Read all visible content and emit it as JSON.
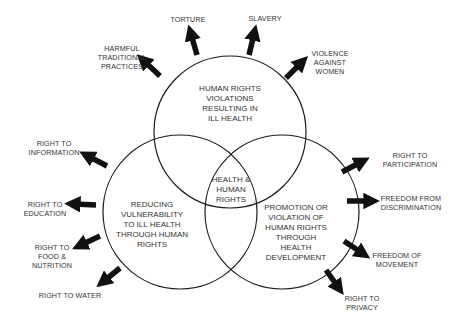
{
  "diagram": {
    "type": "venn-with-arrows",
    "circles": [
      {
        "id": "top",
        "label_lines": [
          "HUMAN RIGHTS",
          "VIOLATIONS",
          "RESULTING IN",
          "ILL HEALTH"
        ]
      },
      {
        "id": "left",
        "label_lines": [
          "REDUCING",
          "VULNERABILITY",
          "TO ILL HEALTH",
          "THROUGH HUMAN",
          "RIGHTS"
        ]
      },
      {
        "id": "right",
        "label_lines": [
          "PROMOTION OR",
          "VIOLATION OF",
          "HUMAN RIGHTS",
          "THROUGH",
          "HEALTH",
          "DEVELOPMENT"
        ]
      }
    ],
    "center": {
      "label_lines": [
        "HEALTH &",
        "HUMAN",
        "RIGHTS"
      ]
    },
    "top_arrows": [
      {
        "label_lines": [
          "HARMFUL",
          "TRADITIONAL",
          "PRACTICES"
        ]
      },
      {
        "label_lines": [
          "TORTURE"
        ]
      },
      {
        "label_lines": [
          "SLAVERY"
        ]
      },
      {
        "label_lines": [
          "VIOLENCE",
          "AGAINST",
          "WOMEN"
        ]
      }
    ],
    "left_arrows": [
      {
        "label_lines": [
          "RIGHT TO",
          "INFORMATION"
        ]
      },
      {
        "label_lines": [
          "RIGHT TO",
          "EDUCATION"
        ]
      },
      {
        "label_lines": [
          "RIGHT TO",
          "FOOD &",
          "NUTRITION"
        ]
      },
      {
        "label_lines": [
          "RIGHT TO WATER"
        ]
      }
    ],
    "right_arrows": [
      {
        "label_lines": [
          "RIGHT TO",
          "PARTICIPATION"
        ]
      },
      {
        "label_lines": [
          "FREEDOM FROM",
          "DISCRIMINATION"
        ]
      },
      {
        "label_lines": [
          "FREEDOM OF",
          "MOVEMENT"
        ]
      },
      {
        "label_lines": [
          "RIGHT TO",
          "PRIVACY"
        ]
      }
    ],
    "colors": {
      "stroke": "#1a1a1a",
      "text": "#333333",
      "background": "#ffffff"
    }
  }
}
